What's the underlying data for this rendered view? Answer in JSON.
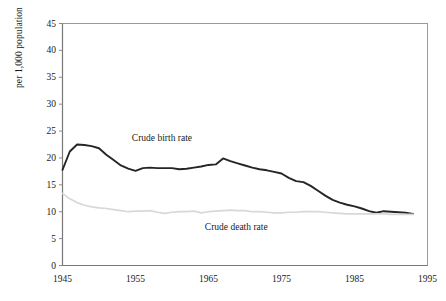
{
  "chart_data": {
    "type": "line",
    "title": "",
    "subtitle": "",
    "xlabel": "",
    "ylabel": "per 1,000 population",
    "xlim": [
      1945,
      1995
    ],
    "ylim": [
      0,
      45
    ],
    "grid": false,
    "legend_position": "inline-annotation",
    "xticks": [
      "1945",
      "1955",
      "1965",
      "1975",
      "1985",
      "1995"
    ],
    "xtick_values": [
      1945,
      1955,
      1965,
      1975,
      1985,
      1995
    ],
    "yticks": [
      "0",
      "5",
      "10",
      "15",
      "20",
      "25",
      "30",
      "35",
      "40",
      "45"
    ],
    "ytick_values": [
      0,
      5,
      10,
      15,
      20,
      25,
      30,
      35,
      40,
      45
    ],
    "x": [
      1945,
      1946,
      1947,
      1948,
      1949,
      1950,
      1951,
      1952,
      1953,
      1954,
      1955,
      1956,
      1957,
      1958,
      1959,
      1960,
      1961,
      1962,
      1963,
      1964,
      1965,
      1966,
      1967,
      1968,
      1969,
      1970,
      1971,
      1972,
      1973,
      1974,
      1975,
      1976,
      1977,
      1978,
      1979,
      1980,
      1981,
      1982,
      1983,
      1984,
      1985,
      1986,
      1987,
      1988,
      1989,
      1990,
      1991,
      1992,
      1993
    ],
    "series": [
      {
        "name": "Crude birth rate",
        "color": "#252525",
        "width": 1.9,
        "values": [
          17.8,
          21.2,
          22.5,
          22.4,
          22.2,
          21.8,
          20.6,
          19.6,
          18.6,
          18.0,
          17.6,
          18.1,
          18.2,
          18.1,
          18.1,
          18.1,
          17.9,
          18.0,
          18.2,
          18.4,
          18.7,
          18.8,
          19.9,
          19.4,
          19.0,
          18.6,
          18.2,
          17.9,
          17.7,
          17.4,
          17.1,
          16.3,
          15.7,
          15.5,
          14.8,
          13.9,
          13.0,
          12.2,
          11.7,
          11.3,
          11.0,
          10.6,
          10.1,
          9.8,
          10.1,
          10.0,
          9.9,
          9.8,
          9.6
        ]
      },
      {
        "name": "Crude death rate",
        "color": "#d8d8d8",
        "width": 1.7,
        "values": [
          13.4,
          12.4,
          11.7,
          11.2,
          10.9,
          10.7,
          10.6,
          10.4,
          10.2,
          10.0,
          10.1,
          10.1,
          10.2,
          9.9,
          9.7,
          9.9,
          10.0,
          10.0,
          10.1,
          9.8,
          10.0,
          10.1,
          10.2,
          10.3,
          10.2,
          10.2,
          10.0,
          10.0,
          9.9,
          9.8,
          9.8,
          9.9,
          9.9,
          10.0,
          10.0,
          10.0,
          9.9,
          9.8,
          9.7,
          9.6,
          9.6,
          9.6,
          9.6,
          9.6,
          9.6,
          9.5,
          9.5,
          9.5,
          9.5
        ]
      }
    ],
    "annotations": [
      {
        "text": "Crude birth rate",
        "x": 1954.5,
        "y": 23.5
      },
      {
        "text": "Crude death rate",
        "x": 1964.5,
        "y": 6.9
      }
    ],
    "frame_color": "#9a9a9a"
  }
}
